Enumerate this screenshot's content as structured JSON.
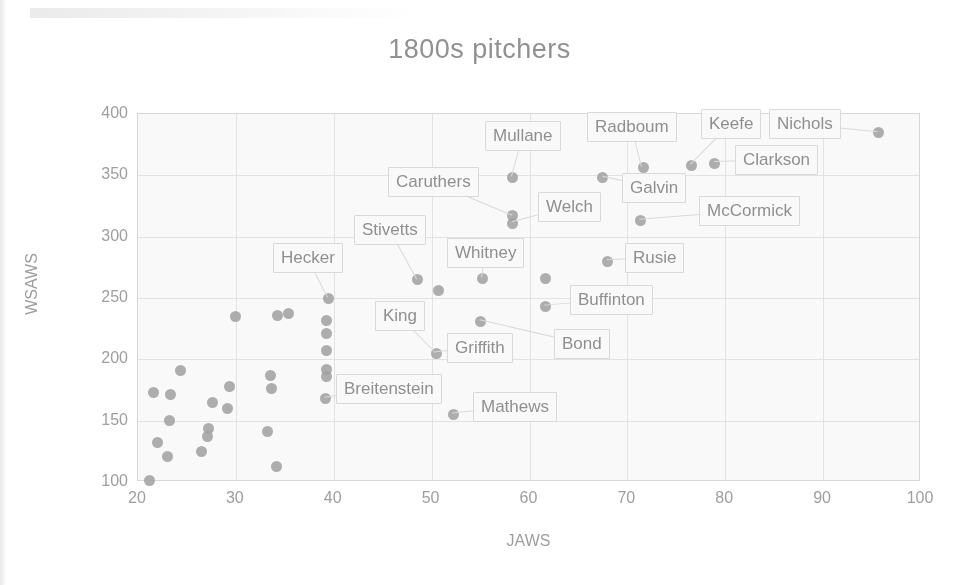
{
  "chart_data": {
    "type": "scatter",
    "title": "1800s pitchers",
    "xlabel": "JAWS",
    "ylabel": "WSAWS",
    "xlim": [
      20,
      100
    ],
    "ylim": [
      100,
      400
    ],
    "xticks": [
      20,
      30,
      40,
      50,
      60,
      70,
      80,
      90,
      100
    ],
    "yticks": [
      100,
      150,
      200,
      250,
      300,
      350,
      400
    ],
    "grid": true,
    "legend": "none",
    "marker_color": "#9e9e9e",
    "points": [
      {
        "label": "Nichols",
        "x": 95.7,
        "y": 385
      },
      {
        "label": "Keefe",
        "x": 76.6,
        "y": 358
      },
      {
        "label": "Clarkson",
        "x": 78.9,
        "y": 360
      },
      {
        "label": "Radboum",
        "x": 71.6,
        "y": 356
      },
      {
        "label": "Galvin",
        "x": 67.5,
        "y": 348
      },
      {
        "label": "McCormick",
        "x": 71.3,
        "y": 313
      },
      {
        "label": "Mullane",
        "x": 58.3,
        "y": 348
      },
      {
        "label": "Caruthers",
        "x": 58.3,
        "y": 317
      },
      {
        "label": "Welch",
        "x": 58.3,
        "y": 311
      },
      {
        "label": "Rusie",
        "x": 68.0,
        "y": 280
      },
      {
        "label": "Whitney",
        "x": 55.2,
        "y": 266
      },
      {
        "label": "Stivetts",
        "x": 48.6,
        "y": 265
      },
      {
        "label": "",
        "x": 61.6,
        "y": 266
      },
      {
        "label": "Buffinton",
        "x": 61.6,
        "y": 243
      },
      {
        "label": "",
        "x": 50.7,
        "y": 256
      },
      {
        "label": "Hecker",
        "x": 39.5,
        "y": 250
      },
      {
        "label": "Bond",
        "x": 55.0,
        "y": 231
      },
      {
        "label": "Griffith",
        "x": 50.5,
        "y": 205
      },
      {
        "label": "Breitenstein",
        "x": 39.2,
        "y": 168
      },
      {
        "label": "Mathews",
        "x": 52.2,
        "y": 155
      },
      {
        "label": "",
        "x": 39.3,
        "y": 232
      },
      {
        "label": "",
        "x": 39.3,
        "y": 221
      },
      {
        "label": "",
        "x": 39.3,
        "y": 207
      },
      {
        "label": "",
        "x": 39.3,
        "y": 192
      },
      {
        "label": "",
        "x": 39.3,
        "y": 186
      },
      {
        "label": "",
        "x": 35.4,
        "y": 237
      },
      {
        "label": "",
        "x": 34.3,
        "y": 236
      },
      {
        "label": "",
        "x": 30.0,
        "y": 235
      },
      {
        "label": "",
        "x": 33.5,
        "y": 187
      },
      {
        "label": "",
        "x": 33.6,
        "y": 176
      },
      {
        "label": "",
        "x": 33.2,
        "y": 141
      },
      {
        "label": "",
        "x": 34.2,
        "y": 113
      },
      {
        "label": "",
        "x": 29.3,
        "y": 178
      },
      {
        "label": "",
        "x": 29.1,
        "y": 160
      },
      {
        "label": "",
        "x": 27.6,
        "y": 165
      },
      {
        "label": "",
        "x": 27.2,
        "y": 144
      },
      {
        "label": "",
        "x": 27.1,
        "y": 137
      },
      {
        "label": "",
        "x": 26.5,
        "y": 125
      },
      {
        "label": "",
        "x": 24.3,
        "y": 191
      },
      {
        "label": "",
        "x": 23.3,
        "y": 171
      },
      {
        "label": "",
        "x": 23.2,
        "y": 150
      },
      {
        "label": "",
        "x": 23.0,
        "y": 121
      },
      {
        "label": "",
        "x": 21.6,
        "y": 173
      },
      {
        "label": "",
        "x": 22.0,
        "y": 132
      },
      {
        "label": "",
        "x": 21.2,
        "y": 101
      }
    ],
    "callouts": [
      {
        "name": "mullane",
        "text": "Mullane",
        "left": 485,
        "top": 121,
        "target_x": 58.3,
        "target_y": 348
      },
      {
        "name": "radboum",
        "text": "Radboum",
        "left": 587,
        "top": 112,
        "target_x": 71.6,
        "target_y": 356
      },
      {
        "name": "keefe",
        "text": "Keefe",
        "left": 701,
        "top": 109,
        "target_x": 76.6,
        "target_y": 358
      },
      {
        "name": "nichols",
        "text": "Nichols",
        "left": 769,
        "top": 109,
        "target_x": 95.7,
        "target_y": 385
      },
      {
        "name": "clarkson",
        "text": "Clarkson",
        "left": 735,
        "top": 145,
        "target_x": 78.9,
        "target_y": 360
      },
      {
        "name": "galvin",
        "text": "Galvin",
        "left": 622,
        "top": 173,
        "target_x": 67.5,
        "target_y": 348
      },
      {
        "name": "caruthers",
        "text": "Caruthers",
        "left": 388,
        "top": 167,
        "target_x": 58.3,
        "target_y": 317
      },
      {
        "name": "welch",
        "text": "Welch",
        "left": 538,
        "top": 192,
        "target_x": 58.3,
        "target_y": 311
      },
      {
        "name": "mccormick",
        "text": "McCormick",
        "left": 699,
        "top": 196,
        "target_x": 71.3,
        "target_y": 313
      },
      {
        "name": "stivetts",
        "text": "Stivetts",
        "left": 354,
        "top": 215,
        "target_x": 48.6,
        "target_y": 265
      },
      {
        "name": "whitney",
        "text": "Whitney",
        "left": 447,
        "top": 238,
        "target_x": 55.2,
        "target_y": 266
      },
      {
        "name": "hecker",
        "text": "Hecker",
        "left": 273,
        "top": 243,
        "target_x": 39.5,
        "target_y": 250
      },
      {
        "name": "rusie",
        "text": "Rusie",
        "left": 625,
        "top": 243,
        "target_x": 68.0,
        "target_y": 280
      },
      {
        "name": "buffinton",
        "text": "Buffinton",
        "left": 570,
        "top": 285,
        "target_x": 61.6,
        "target_y": 243
      },
      {
        "name": "king",
        "text": "King",
        "left": 375,
        "top": 301,
        "target_x": 50.5,
        "target_y": 205
      },
      {
        "name": "griffith",
        "text": "Griffith",
        "left": 447,
        "top": 333,
        "target_x": 50.5,
        "target_y": 205
      },
      {
        "name": "bond",
        "text": "Bond",
        "left": 554,
        "top": 329,
        "target_x": 55.0,
        "target_y": 231
      },
      {
        "name": "breitenstein",
        "text": "Breitenstein",
        "left": 336,
        "top": 374,
        "target_x": 39.2,
        "target_y": 168
      },
      {
        "name": "mathews",
        "text": "Mathews",
        "left": 473,
        "top": 392,
        "target_x": 52.2,
        "target_y": 155
      }
    ]
  }
}
